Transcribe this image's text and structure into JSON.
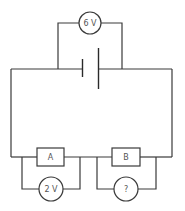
{
  "diagram": {
    "type": "circuit",
    "colors": {
      "stroke": "#3a3a3a",
      "text": "#555555",
      "background": "#ffffff"
    },
    "battery": {
      "label": ""
    },
    "meters": [
      {
        "id": "voltmeter-battery",
        "label": "6 V"
      },
      {
        "id": "voltmeter-a",
        "label": "2 V"
      },
      {
        "id": "voltmeter-b",
        "label": "?"
      }
    ],
    "resistors": [
      {
        "id": "resistor-a",
        "label": "A"
      },
      {
        "id": "resistor-b",
        "label": "B"
      }
    ]
  }
}
